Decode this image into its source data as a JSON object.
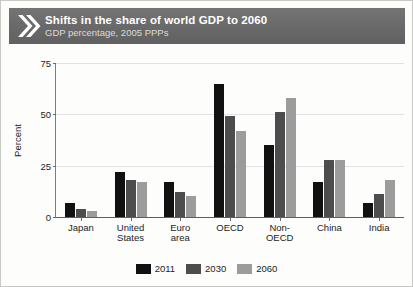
{
  "banner": {
    "title": "Shifts in the share of world GDP to 2060",
    "subtitle": "GDP percentage, 2005 PPPs",
    "icon": "double-chevron-right-icon",
    "background_color": "#6e6e6e",
    "title_color": "#ffffff",
    "subtitle_color": "#dcdcdc"
  },
  "chart_data": {
    "type": "bar",
    "title": "Shifts in the share of world GDP to 2060",
    "subtitle": "GDP percentage, 2005 PPPs",
    "xlabel": "",
    "ylabel": "Percent",
    "ylim": [
      0,
      75
    ],
    "yticks": [
      0,
      25,
      50,
      75
    ],
    "ytick_labels": [
      "0",
      "25",
      "50",
      "75"
    ],
    "grid": true,
    "grid_axis": "y",
    "legend_position": "bottom",
    "categories": [
      "Japan",
      "United\nStates",
      "Euro\narea",
      "OECD",
      "Non-\nOECD",
      "China",
      "India"
    ],
    "series": [
      {
        "name": "2011",
        "color": "#111111",
        "values": [
          7,
          22,
          17,
          65,
          35,
          17,
          7
        ]
      },
      {
        "name": "2030",
        "color": "#4d4d4d",
        "values": [
          4,
          18,
          12,
          49,
          51,
          28,
          11
        ]
      },
      {
        "name": "2060",
        "color": "#9c9c9c",
        "values": [
          3,
          17,
          10,
          42,
          58,
          28,
          18
        ]
      }
    ]
  }
}
